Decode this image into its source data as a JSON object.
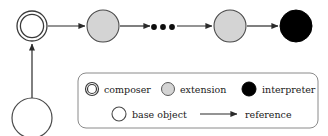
{
  "diagram": {
    "colors": {
      "stroke": "#3a3a3a",
      "composer_fill": "#ffffff",
      "extension_fill": "#d4d4d4",
      "interpreter_fill": "#000000",
      "base_object_fill": "#ffffff",
      "legend_border": "#8a8a8a",
      "background": "#ffffff",
      "text": "#1a1a1a"
    },
    "chain": {
      "nodes": [
        {
          "id": "composer-node",
          "type": "composer",
          "shape": "double-circle",
          "cx": 32,
          "cy": 26,
          "r": 15,
          "inner_r": 12,
          "fill": "#ffffff"
        },
        {
          "id": "extension-node-1",
          "type": "extension",
          "shape": "circle",
          "cx": 103,
          "cy": 26,
          "r": 16,
          "fill": "#d4d4d4"
        },
        {
          "id": "ellipsis",
          "type": "ellipsis",
          "shape": "dots",
          "cx": 162,
          "cy": 27,
          "dots": 3
        },
        {
          "id": "extension-node-2",
          "type": "extension",
          "shape": "circle",
          "cx": 230,
          "cy": 26,
          "r": 16,
          "fill": "#d4d4d4"
        },
        {
          "id": "interpreter-node",
          "type": "interpreter",
          "shape": "circle",
          "cx": 296,
          "cy": 26,
          "r": 16,
          "fill": "#000000"
        }
      ],
      "base_object": {
        "id": "base-object-node",
        "type": "base object",
        "shape": "circle",
        "cx": 32,
        "cy": 118,
        "r": 20,
        "fill": "#ffffff"
      },
      "arrows": [
        {
          "id": "arrow-composer-to-extension-1",
          "from": "composer-node",
          "to": "extension-node-1",
          "x1": 48,
          "y1": 26,
          "x2": 85,
          "y2": 26
        },
        {
          "id": "arrow-extension-1-to-ellipsis",
          "from": "extension-node-1",
          "to": "ellipsis",
          "x1": 120,
          "y1": 26,
          "x2": 150,
          "y2": 26
        },
        {
          "id": "arrow-ellipsis-to-extension-2",
          "from": "ellipsis",
          "to": "extension-node-2",
          "x1": 177,
          "y1": 26,
          "x2": 212,
          "y2": 26
        },
        {
          "id": "arrow-extension-2-to-interpreter",
          "from": "extension-node-2",
          "to": "interpreter-node",
          "x1": 247,
          "y1": 26,
          "x2": 278,
          "y2": 26
        },
        {
          "id": "arrow-base-object-to-composer",
          "from": "base-object-node",
          "to": "composer-node",
          "x1": 32,
          "y1": 98,
          "x2": 32,
          "y2": 44
        }
      ]
    },
    "legend": {
      "box": {
        "x": 78,
        "y": 73,
        "width": 240,
        "height": 55,
        "radius": 8
      },
      "rows": [
        {
          "id": "legend-row-1",
          "items": [
            {
              "id": "legend-composer",
              "swatch": "double-circle",
              "label": "composer",
              "cx": 92,
              "cy": 89,
              "r": 6.5,
              "inner_r": 4.6,
              "fill": "#ffffff",
              "label_x": 104,
              "label_y": 92
            },
            {
              "id": "legend-extension",
              "swatch": "circle",
              "label": "extension",
              "cx": 168,
              "cy": 89,
              "r": 6.5,
              "fill": "#d4d4d4",
              "label_x": 180,
              "label_y": 92
            },
            {
              "id": "legend-interpreter",
              "swatch": "circle",
              "label": "interpreter",
              "cx": 249,
              "cy": 89,
              "r": 7,
              "fill": "#000000",
              "label_x": 262,
              "label_y": 92
            }
          ]
        },
        {
          "id": "legend-row-2",
          "items": [
            {
              "id": "legend-base-object",
              "swatch": "circle",
              "label": "base object",
              "cx": 119,
              "cy": 114,
              "r": 7,
              "fill": "#ffffff",
              "label_x": 132,
              "label_y": 117
            },
            {
              "id": "legend-reference",
              "swatch": "arrow",
              "label": "reference",
              "x1": 200,
              "y1": 114,
              "x2": 237,
              "y2": 114,
              "label_x": 244,
              "label_y": 117
            }
          ]
        }
      ]
    }
  }
}
